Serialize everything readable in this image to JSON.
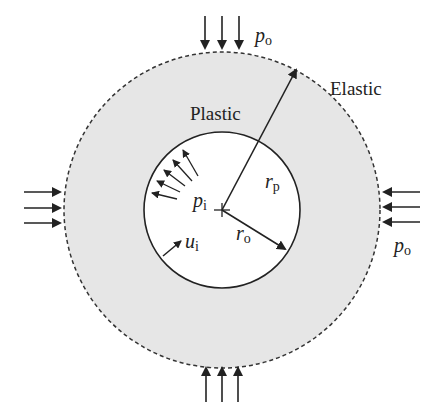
{
  "diagram": {
    "type": "plastic-zone around circular opening",
    "labels": {
      "plastic": "Plastic",
      "elastic": "Elastic"
    },
    "symbols": {
      "far_field_pressure": {
        "base": "p",
        "sub": "o"
      },
      "internal_pressure": {
        "base": "p",
        "sub": "i"
      },
      "plastic_radius": {
        "base": "r",
        "sub": "p"
      },
      "opening_radius": {
        "base": "r",
        "sub": "o"
      },
      "displacement": {
        "base": "u",
        "sub": "i"
      }
    },
    "colors": {
      "plastic_zone_fill": "#e6e6e6",
      "opening_fill": "#ffffff",
      "stroke": "#222222"
    },
    "geometry": {
      "center": [
        222,
        210
      ],
      "opening_radius_px": 78,
      "plastic_radius_px": 158
    },
    "load_arrows": {
      "top": {
        "count": 3,
        "direction": "down"
      },
      "bottom": {
        "count": 3,
        "direction": "up"
      },
      "left": {
        "count": 3,
        "direction": "right"
      },
      "right": {
        "count": 3,
        "direction": "left"
      }
    }
  }
}
